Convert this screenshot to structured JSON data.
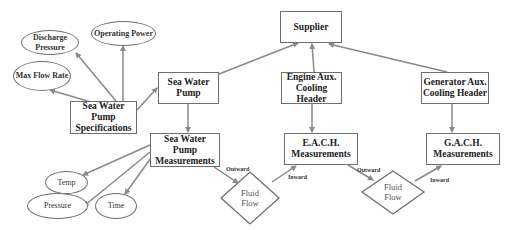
{
  "diagram": {
    "nodes": {
      "supplier": "Supplier",
      "sea_water_pump": "Sea Water Pump",
      "swp_specifications": "Sea Water Pump Specifications",
      "swp_measurements": "Sea Water Pump Measurements",
      "engine_aux_cooling_header": "Engine Aux. Cooling Header",
      "generator_aux_cooling_header": "Generator Aux. Cooling Header",
      "each_measurements": "E.A.C.H. Measurements",
      "gach_measurements": "G.A.C.H. Measurements",
      "discharge_pressure": "Discharge Pressure",
      "operating_power": "Operating Power",
      "max_flow_rate": "Max Flow Rate",
      "temp": "Temp",
      "pressure": "Pressure",
      "time": "Time",
      "fluid_flow_1": "Fluid Flow",
      "fluid_flow_2": "Fluid Flow"
    },
    "edge_labels": {
      "outward_1": "Outward",
      "inward_1": "Inward",
      "outward_2": "Outward",
      "inward_2": "Inward"
    },
    "edges": [
      {
        "from": "sea_water_pump",
        "to": "supplier"
      },
      {
        "from": "engine_aux_cooling_header",
        "to": "supplier"
      },
      {
        "from": "generator_aux_cooling_header",
        "to": "supplier"
      },
      {
        "from": "swp_specifications",
        "to": "sea_water_pump"
      },
      {
        "from": "swp_specifications",
        "to": "discharge_pressure"
      },
      {
        "from": "swp_specifications",
        "to": "operating_power"
      },
      {
        "from": "swp_specifications",
        "to": "max_flow_rate"
      },
      {
        "from": "sea_water_pump",
        "to": "swp_measurements"
      },
      {
        "from": "swp_measurements",
        "to": "temp"
      },
      {
        "from": "swp_measurements",
        "to": "pressure"
      },
      {
        "from": "swp_measurements",
        "to": "time"
      },
      {
        "from": "swp_measurements",
        "to": "fluid_flow_1",
        "label": "Outward"
      },
      {
        "from": "fluid_flow_1",
        "to": "each_measurements",
        "label": "Inward"
      },
      {
        "from": "engine_aux_cooling_header",
        "to": "each_measurements"
      },
      {
        "from": "each_measurements",
        "to": "fluid_flow_2",
        "label": "Outward"
      },
      {
        "from": "fluid_flow_2",
        "to": "gach_measurements",
        "label": "Inward"
      },
      {
        "from": "generator_aux_cooling_header",
        "to": "gach_measurements"
      }
    ],
    "colors": {
      "line": "#8a8a8a",
      "border": "#6e6e6e",
      "text": "#222222"
    }
  }
}
